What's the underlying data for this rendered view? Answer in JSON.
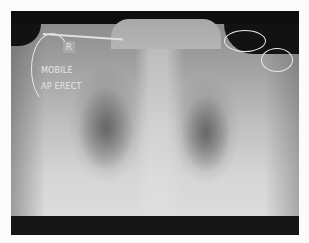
{
  "image": {
    "kind": "chest radiograph",
    "annotations": {
      "side_marker": "R",
      "line1": "MOBILE",
      "line2": "AP ERECT"
    },
    "colors": {
      "border": "#0e0e0e",
      "background": "#fbfbfb",
      "annotation_text": "#e6e6e6"
    }
  }
}
